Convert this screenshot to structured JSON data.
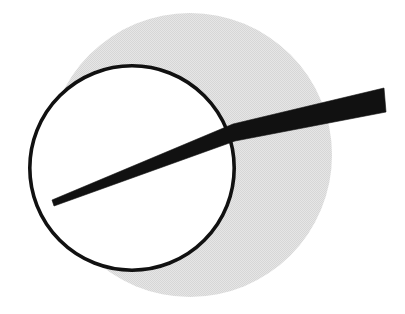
{
  "figure": {
    "canvas": {
      "width": 405,
      "height": 314,
      "background_color": "#ffffff"
    },
    "colors": {
      "background": "#ffffff",
      "shaded_disc_fill": "#e2e2e2",
      "circle_fill": "#ffffff",
      "circle_stroke": "#111111",
      "ray_fill": "#111111"
    },
    "shapes": {
      "shaded_disc": {
        "label": "shaded gray disc",
        "type": "circle",
        "center_x": 190,
        "center_y": 155,
        "radius": 142,
        "fill": "#e2e2e2",
        "stroke": "none",
        "pattern": "halftone-dither"
      },
      "outlined_circle": {
        "label": "outlined white circle",
        "type": "circle",
        "center_x": 132,
        "center_y": 168,
        "radius": 104,
        "fill": "#ffffff",
        "stroke": "#111111",
        "stroke_width": 3.6
      },
      "tapered_ray": {
        "label": "tapered black ray / wedge",
        "type": "polygon",
        "fill": "#111111",
        "description": "thin line inside the circle widening to a thick bar outside to the right",
        "points": [
          [
            52,
            200
          ],
          [
            233,
            124
          ],
          [
            384,
            88
          ],
          [
            386,
            112
          ],
          [
            235,
            141
          ],
          [
            54,
            206
          ]
        ],
        "tip_left_x": 52,
        "tip_left_y": 202,
        "tip_right_x": 385,
        "tip_right_y": 100,
        "crossing_x": 234,
        "crossing_y": 132,
        "max_thickness": 24,
        "min_thickness": 5
      }
    }
  }
}
